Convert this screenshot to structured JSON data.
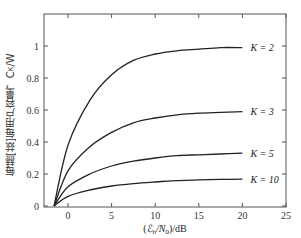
{
  "chart_data": {
    "type": "line",
    "title": "",
    "xlabel": "(ℰb/N0)/dB",
    "ylabel": "每赫[兹]每用户容量, C_K/W",
    "xlim": [
      -2.8,
      25
    ],
    "ylim": [
      0,
      1.2
    ],
    "x_ticks": [
      0,
      5,
      10,
      15,
      20,
      25
    ],
    "y_ticks": [
      0,
      0.2,
      0.4,
      0.6,
      0.8,
      1
    ],
    "x_tick_labels": [
      "0",
      "5",
      "10",
      "15",
      "20",
      "25"
    ],
    "y_tick_labels": [
      "0",
      "0.2",
      "0.4",
      "0.6",
      "0.8",
      "1"
    ],
    "grid": false,
    "legend": "inline labels at right end of curves",
    "x": [
      -1.6,
      0,
      2.5,
      5,
      7.5,
      10,
      12.5,
      15,
      17.5,
      20
    ],
    "series": [
      {
        "name": "K = 2",
        "label": "K = 2",
        "values": [
          0,
          0.38,
          0.66,
          0.82,
          0.91,
          0.95,
          0.97,
          0.98,
          0.99,
          0.99
        ]
      },
      {
        "name": "K = 3",
        "label": "K = 3",
        "values": [
          0,
          0.22,
          0.37,
          0.46,
          0.52,
          0.55,
          0.57,
          0.58,
          0.585,
          0.59
        ]
      },
      {
        "name": "K = 5",
        "label": "K = 5",
        "values": [
          0,
          0.12,
          0.2,
          0.25,
          0.28,
          0.3,
          0.315,
          0.32,
          0.325,
          0.33
        ]
      },
      {
        "name": "K = 10",
        "label": "K = 10",
        "values": [
          0,
          0.06,
          0.1,
          0.125,
          0.14,
          0.15,
          0.158,
          0.163,
          0.166,
          0.168
        ]
      }
    ]
  },
  "axes": {
    "xlabel_display": "(ℰ",
    "xlabel_sub": "b",
    "xlabel_mid": "/N",
    "xlabel_sub2": "0",
    "xlabel_end": ")/dB",
    "ylabel_display": "每赫[兹]每用户容量，C",
    "ylabel_sub": "K",
    "ylabel_end": "/W"
  }
}
